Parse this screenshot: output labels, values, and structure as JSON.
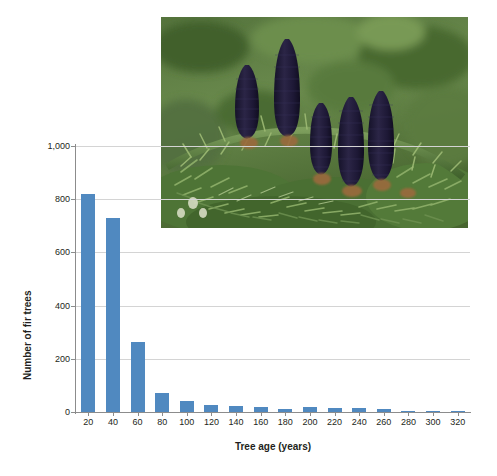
{
  "figure": {
    "background_color": "#ffffff",
    "bar_color": "#5089c0",
    "grid_color": "#d4d4d4",
    "axis_color": "#8c8c8c",
    "text_color": "#231f20"
  },
  "photo": {
    "alt": "Photograph of dark purple upright fir cones on green fir branches",
    "subject": "fir cones",
    "cone_color": "#241f3a",
    "foliage_color": "#4f7d3c",
    "background_color": "#5f7f44"
  },
  "chart_data": {
    "type": "bar",
    "title": "",
    "xlabel": "Tree age (years)",
    "ylabel": "Number of fir trees",
    "categories": [
      "20",
      "40",
      "60",
      "80",
      "100",
      "120",
      "140",
      "160",
      "180",
      "200",
      "220",
      "240",
      "260",
      "280",
      "300",
      "320"
    ],
    "values": [
      820,
      730,
      265,
      72,
      40,
      25,
      22,
      20,
      10,
      18,
      15,
      15,
      12,
      3,
      4,
      2
    ],
    "ylim": [
      0,
      1000
    ],
    "yticks": [
      0,
      200,
      400,
      600,
      800,
      1000
    ],
    "ytick_labels": [
      "0",
      "200",
      "400",
      "600",
      "800",
      "1,000"
    ],
    "grid": "horizontal",
    "legend": "none"
  }
}
